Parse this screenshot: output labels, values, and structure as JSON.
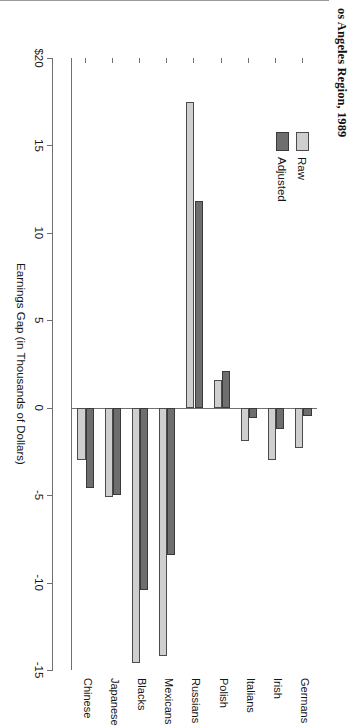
{
  "title": "os Angeles Region, 1989",
  "legend": {
    "position": "inside-left",
    "items": [
      {
        "label": "Raw",
        "color": "#cfcfcf",
        "key": "raw"
      },
      {
        "label": "Adjusted",
        "color": "#6e6e6e",
        "key": "adjusted"
      }
    ]
  },
  "chart_data": {
    "type": "bar",
    "orientation": "horizontal",
    "title": "os Angeles Region, 1989",
    "xlabel": "",
    "ylabel": "Earnings Gap (in Thousands of Dollars)",
    "value_axis_title": "Earnings Gap (in Thousands of Dollars)",
    "grid": false,
    "ylim": [
      -15,
      20
    ],
    "value_ticks": [
      {
        "value": 20,
        "label": "$20"
      },
      {
        "value": 15,
        "label": "15"
      },
      {
        "value": 10,
        "label": "10"
      },
      {
        "value": 5,
        "label": "5"
      },
      {
        "value": 0,
        "label": "0"
      },
      {
        "value": -5,
        "label": "-5"
      },
      {
        "value": -10,
        "label": "-10"
      },
      {
        "value": -15,
        "label": "-15"
      }
    ],
    "categories": [
      "Germans",
      "Irish",
      "Italians",
      "Polish",
      "Russians",
      "Mexicans",
      "Blacks",
      "Japanese",
      "Chinese"
    ],
    "series": [
      {
        "name": "Raw",
        "color": "#cfcfcf",
        "values": [
          -2.3,
          -3.0,
          -1.9,
          1.6,
          17.5,
          -14.2,
          -14.6,
          -5.1,
          -3.0
        ]
      },
      {
        "name": "Adjusted",
        "color": "#6e6e6e",
        "values": [
          -0.5,
          -1.2,
          -0.6,
          2.1,
          11.8,
          -8.4,
          -10.4,
          -5.0,
          -4.6
        ]
      }
    ]
  }
}
